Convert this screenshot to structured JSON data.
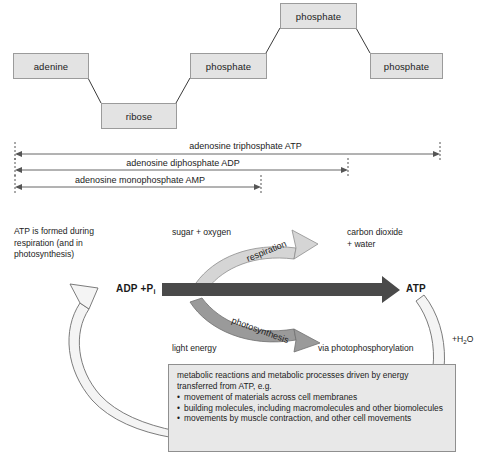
{
  "molecule": {
    "components": [
      {
        "name": "adenine",
        "label": "adenine"
      },
      {
        "name": "ribose",
        "label": "ribose"
      },
      {
        "name": "phosphate-1",
        "label": "phosphate"
      },
      {
        "name": "phosphate-2",
        "label": "phosphate"
      },
      {
        "name": "phosphate-3",
        "label": "phosphate"
      }
    ]
  },
  "brackets": [
    {
      "label": "adenosine triphosphate ATP"
    },
    {
      "label": "adenosine diphosphate ADP"
    },
    {
      "label": "adenosine monophosphate AMP"
    }
  ],
  "cycle": {
    "intro": "ATP is formed during\nrespiration (and in\nphotosynthesis)",
    "reactant_top": "sugar + oxygen",
    "product_top": "carbon dioxide\n+ water",
    "reactant_bottom": "light energy",
    "product_bottom": "via photophosphorylation",
    "arrow_up_label": "respiration",
    "arrow_down_label": "photosynthesis",
    "left_label": "ADP +P",
    "left_label_sub": "i",
    "right_label": "ATP",
    "water_label": "+H",
    "water_sub": "2",
    "water_tail": "O"
  },
  "info_panel": {
    "lead": "metabolic reactions and metabolic processes driven by energy transferred from ATP, e.g.",
    "bullets": [
      "movement of materials across cell membranes",
      "building molecules, including macromolecules and other biomolecules",
      "movements by muscle contraction, and other cell movements"
    ]
  },
  "colors": {
    "box_fill": "#e3e3e3",
    "box_stroke": "#9b9b9b",
    "panel_fill": "#e8e8e8",
    "dark_arrow": "#4a4a4a",
    "respiration_arrow": "#d5d5d5",
    "photosynthesis_arrow": "#9a9a9a",
    "loop_arrow": "#f2f2f2",
    "line": "#555555"
  }
}
